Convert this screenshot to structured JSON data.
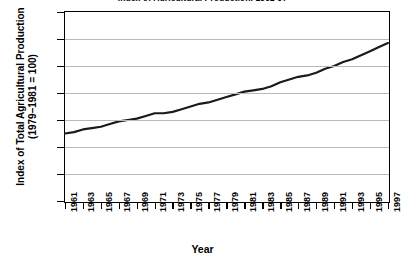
{
  "chart_data": {
    "type": "line",
    "title": "Index of Agricultural Production, 1961-97",
    "xlabel": "Year",
    "ylabel": "Index of Total Agricultural Production\n(1979–1981 = 100)",
    "ylabel_line1": "Index of Total Agricultural Production",
    "ylabel_line2": "(1979–1981 = 100)",
    "ylim": [
      0,
      140
    ],
    "ytick_step": 20,
    "yticks": [
      0,
      20,
      40,
      60,
      80,
      100,
      120,
      140
    ],
    "xlim": [
      1961,
      1997
    ],
    "xticks": [
      1961,
      1963,
      1965,
      1967,
      1969,
      1971,
      1973,
      1975,
      1977,
      1979,
      1981,
      1983,
      1985,
      1987,
      1989,
      1991,
      1993,
      1995,
      1997
    ],
    "grid": true,
    "grid_axis": "y",
    "legend": false,
    "line_color": "#1a1a1a",
    "line_width": 2.2,
    "x": [
      1961,
      1962,
      1963,
      1964,
      1965,
      1966,
      1967,
      1968,
      1969,
      1970,
      1971,
      1972,
      1973,
      1974,
      1975,
      1976,
      1977,
      1978,
      1979,
      1980,
      1981,
      1982,
      1983,
      1984,
      1985,
      1986,
      1987,
      1988,
      1989,
      1990,
      1991,
      1992,
      1993,
      1994,
      1995,
      1996,
      1997
    ],
    "values": [
      50,
      51,
      53,
      54,
      55,
      57,
      59,
      60,
      61,
      63,
      65,
      65,
      66,
      68,
      70,
      72,
      73,
      75,
      77,
      79,
      81,
      82,
      83,
      85,
      88,
      90,
      92,
      93,
      95,
      98,
      100,
      103,
      105,
      108,
      111,
      114,
      117
    ]
  },
  "axes": {
    "y_axis_name": "y-axis",
    "x_axis_name": "x-axis"
  }
}
